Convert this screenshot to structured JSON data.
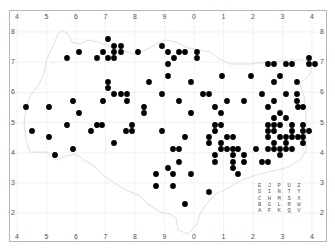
{
  "map": {
    "x_ticks_top": [
      "4",
      "5",
      "6",
      "7",
      "8",
      "9",
      "0",
      "1",
      "2",
      "3",
      "4"
    ],
    "x_ticks_bottom": [
      "4",
      "5",
      "6",
      "7",
      "8",
      "9",
      "0",
      "1",
      "2",
      "3",
      "4"
    ],
    "y_ticks_left": [
      "8",
      "7",
      "6",
      "5",
      "4",
      "3",
      "2"
    ],
    "y_ticks_right": [
      "8",
      "7",
      "6",
      "5",
      "4",
      "3",
      "2"
    ],
    "colors": {
      "frame": "#b8b8b8",
      "grid": "#ececec",
      "outline": "#d6d6d6",
      "dot": "#000000",
      "text": "#555555"
    },
    "letter_grid": {
      "rows": [
        "E J P U Z",
        "D I N T Y",
        "C H M S X",
        "B G L R W",
        "A F K Q V"
      ]
    },
    "points_px": [
      [
        108,
        39
      ],
      [
        114,
        46
      ],
      [
        121,
        46
      ],
      [
        103,
        52
      ],
      [
        114,
        52
      ],
      [
        121,
        52
      ],
      [
        108,
        58
      ],
      [
        114,
        58
      ],
      [
        138,
        52
      ],
      [
        162,
        46
      ],
      [
        168,
        52
      ],
      [
        179,
        52
      ],
      [
        185,
        52
      ],
      [
        197,
        52
      ],
      [
        174,
        58
      ],
      [
        197,
        58
      ],
      [
        168,
        64
      ],
      [
        168,
        76
      ],
      [
        108,
        82
      ],
      [
        108,
        88
      ],
      [
        149,
        82
      ],
      [
        191,
        82
      ],
      [
        114,
        94
      ],
      [
        121,
        94
      ],
      [
        127,
        94
      ],
      [
        162,
        94
      ],
      [
        203,
        94
      ],
      [
        209,
        94
      ],
      [
        103,
        101
      ],
      [
        127,
        101
      ],
      [
        179,
        101
      ],
      [
        144,
        107
      ],
      [
        79,
        52
      ],
      [
        67,
        58
      ],
      [
        97,
        58
      ],
      [
        222,
        76
      ],
      [
        251,
        76
      ],
      [
        268,
        64
      ],
      [
        274,
        64
      ],
      [
        286,
        64
      ],
      [
        292,
        64
      ],
      [
        309,
        58
      ],
      [
        309,
        64
      ],
      [
        315,
        64
      ],
      [
        280,
        76
      ],
      [
        274,
        82
      ],
      [
        297,
        82
      ],
      [
        262,
        94
      ],
      [
        286,
        94
      ],
      [
        297,
        94
      ],
      [
        227,
        101
      ],
      [
        244,
        101
      ],
      [
        274,
        101
      ],
      [
        297,
        101
      ],
      [
        215,
        107
      ],
      [
        268,
        107
      ],
      [
        303,
        107
      ],
      [
        26,
        107
      ],
      [
        49,
        107
      ],
      [
        73,
        101
      ],
      [
        79,
        113
      ],
      [
        67,
        125
      ],
      [
        97,
        125
      ],
      [
        102,
        125
      ],
      [
        32,
        131
      ],
      [
        49,
        137
      ],
      [
        91,
        131
      ],
      [
        114,
        143
      ],
      [
        73,
        149
      ],
      [
        55,
        155
      ],
      [
        144,
        113
      ],
      [
        191,
        113
      ],
      [
        221,
        113
      ],
      [
        132,
        125
      ],
      [
        126,
        131
      ],
      [
        132,
        131
      ],
      [
        162,
        131
      ],
      [
        185,
        137
      ],
      [
        173,
        149
      ],
      [
        179,
        149
      ],
      [
        179,
        162
      ],
      [
        168,
        168
      ],
      [
        156,
        174
      ],
      [
        173,
        174
      ],
      [
        191,
        174
      ],
      [
        156,
        186
      ],
      [
        173,
        186
      ],
      [
        209,
        192
      ],
      [
        185,
        204
      ],
      [
        215,
        125
      ],
      [
        221,
        125
      ],
      [
        215,
        131
      ],
      [
        209,
        137
      ],
      [
        227,
        137
      ],
      [
        209,
        143
      ],
      [
        221,
        143
      ],
      [
        221,
        149
      ],
      [
        227,
        149
      ],
      [
        215,
        155
      ],
      [
        215,
        162
      ],
      [
        298,
        107
      ],
      [
        280,
        113
      ],
      [
        274,
        118
      ],
      [
        286,
        118
      ],
      [
        268,
        125
      ],
      [
        274,
        125
      ],
      [
        280,
        125
      ],
      [
        292,
        125
      ],
      [
        303,
        125
      ],
      [
        268,
        131
      ],
      [
        274,
        131
      ],
      [
        292,
        131
      ],
      [
        303,
        131
      ],
      [
        309,
        131
      ],
      [
        268,
        137
      ],
      [
        280,
        137
      ],
      [
        286,
        137
      ],
      [
        292,
        137
      ],
      [
        298,
        137
      ],
      [
        303,
        137
      ],
      [
        274,
        143
      ],
      [
        286,
        143
      ],
      [
        303,
        143
      ],
      [
        233,
        137
      ],
      [
        233,
        149
      ],
      [
        238,
        149
      ],
      [
        256,
        149
      ],
      [
        268,
        149
      ],
      [
        274,
        149
      ],
      [
        280,
        149
      ],
      [
        286,
        149
      ],
      [
        292,
        149
      ],
      [
        280,
        155
      ],
      [
        233,
        155
      ],
      [
        244,
        155
      ],
      [
        233,
        162
      ],
      [
        244,
        162
      ],
      [
        262,
        162
      ],
      [
        268,
        162
      ],
      [
        233,
        168
      ],
      [
        238,
        174
      ]
    ]
  }
}
